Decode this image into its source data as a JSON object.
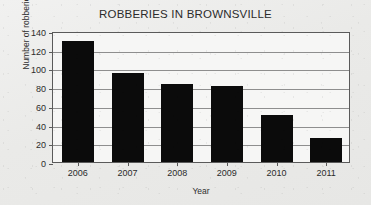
{
  "chart_data": {
    "type": "bar",
    "title": "ROBBERIES IN BROWNSVILLE",
    "xlabel": "Year",
    "ylabel": "Number of robberies",
    "categories": [
      "2006",
      "2007",
      "2008",
      "2009",
      "2010",
      "2011"
    ],
    "values": [
      129,
      95,
      83,
      81,
      50,
      26
    ],
    "ylim": [
      0,
      140
    ],
    "yticks": [
      0,
      20,
      40,
      60,
      80,
      100,
      120,
      140
    ],
    "grid": true,
    "legend": false,
    "bar_color": "#0b0b0b",
    "background_color": "#ecece9",
    "axis_color": "#5a5a5a"
  }
}
